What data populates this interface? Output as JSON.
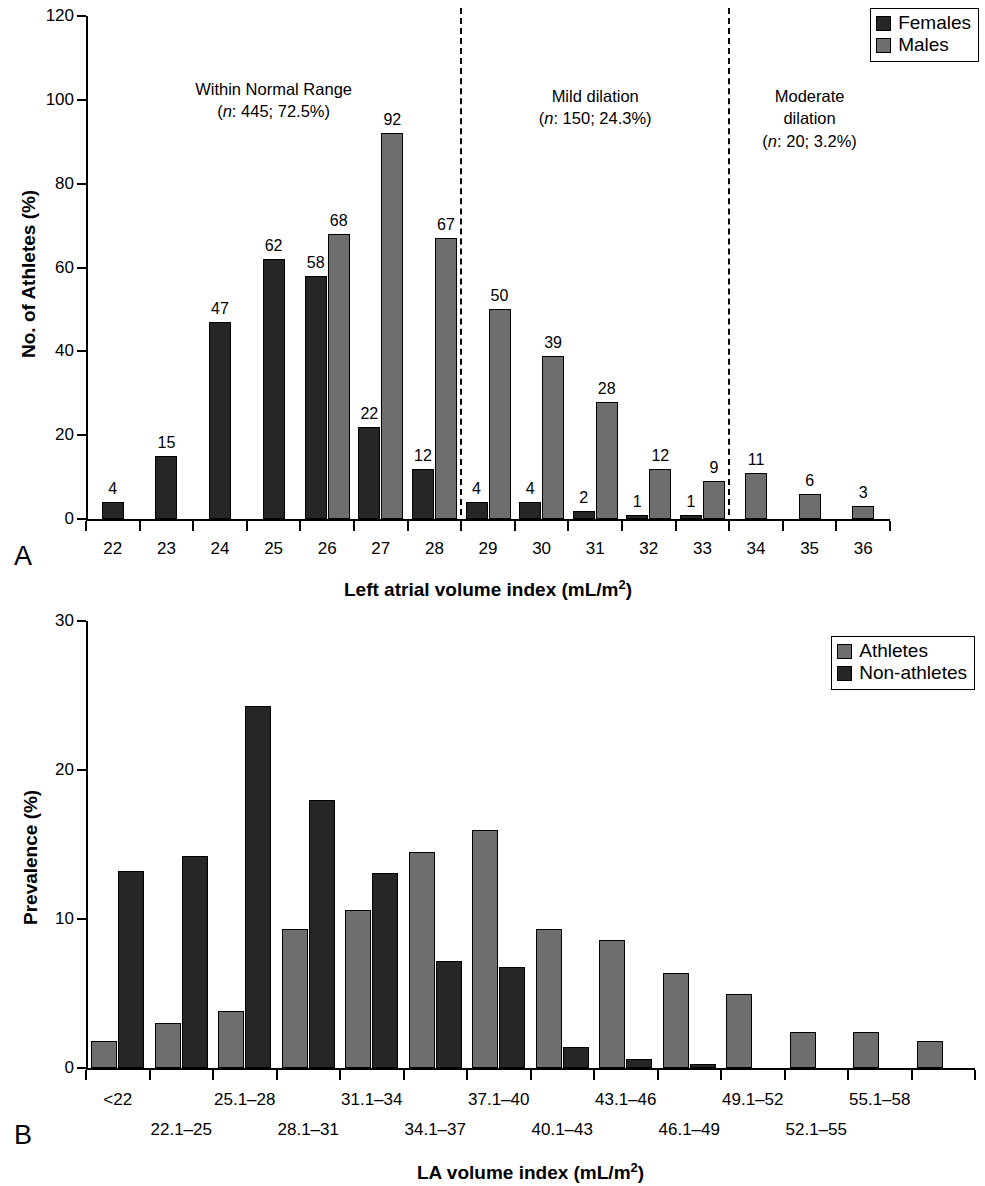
{
  "figure": {
    "panels": [
      {
        "letter": "A"
      },
      {
        "letter": "B"
      }
    ]
  },
  "panelA": {
    "letter": "A",
    "ylabel": "No. of Athletes (%)",
    "xlabel_main": "Left atrial volume index (mL/m",
    "xlabel_sup": "2",
    "xlabel_tail": ")",
    "legend": [
      {
        "key": "females",
        "label": "Females",
        "color": "#262626"
      },
      {
        "key": "males",
        "label": "Males",
        "color": "#6e6e6e"
      }
    ],
    "regions": [
      {
        "title": "Within Normal Range",
        "n_label": "n",
        "n_text": ": 445; 72.5%"
      },
      {
        "title": "Mild dilation",
        "n_label": "n",
        "n_text": ": 150; 24.3%"
      },
      {
        "title_line1": "Moderate",
        "title_line2": "dilation",
        "n_label": "n",
        "n_text": ": 20; 3.2%"
      }
    ]
  },
  "panelB": {
    "letter": "B",
    "ylabel": "Prevalence (%)",
    "xlabel_main": "LA volume index (mL/m",
    "xlabel_sup": "2",
    "xlabel_tail": ")",
    "legend": [
      {
        "key": "athletes",
        "label": "Athletes",
        "color": "#6e6e6e"
      },
      {
        "key": "non-athletes",
        "label": "Non-athletes",
        "color": "#262626"
      }
    ]
  },
  "chart_data": [
    {
      "id": "panel-a",
      "type": "bar",
      "title": "",
      "xlabel": "Left atrial volume index (mL/m2)",
      "ylabel": "No. of Athletes (%)",
      "ylim": [
        0,
        120
      ],
      "yticks": [
        0,
        20,
        40,
        60,
        80,
        100,
        120
      ],
      "grid": false,
      "legend_position": "top-right",
      "categories": [
        "22",
        "23",
        "24",
        "25",
        "26",
        "27",
        "28",
        "29",
        "30",
        "31",
        "32",
        "33",
        "34",
        "35",
        "36"
      ],
      "series": [
        {
          "name": "Females",
          "color": "#262626",
          "values": [
            4,
            15,
            47,
            62,
            58,
            22,
            12,
            4,
            4,
            2,
            1,
            1,
            null,
            null,
            null
          ]
        },
        {
          "name": "Males",
          "color": "#6e6e6e",
          "values": [
            null,
            null,
            null,
            null,
            68,
            92,
            67,
            50,
            39,
            28,
            12,
            9,
            11,
            6,
            3
          ]
        }
      ],
      "annotations": [
        {
          "text": "Within Normal Range (n: 445; 72.5%)",
          "region_categories": [
            "22",
            "28"
          ]
        },
        {
          "text": "Mild dilation (n: 150; 24.3%)",
          "region_categories": [
            "29",
            "33"
          ]
        },
        {
          "text": "Moderate dilation (n: 20; 3.2%)",
          "region_categories": [
            "34",
            "36"
          ]
        }
      ],
      "dividers_after_category": [
        "28",
        "33"
      ]
    },
    {
      "id": "panel-b",
      "type": "bar",
      "title": "",
      "xlabel": "LA volume index (mL/m2)",
      "ylabel": "Prevalence (%)",
      "ylim": [
        0,
        30
      ],
      "yticks": [
        0,
        10,
        20,
        30
      ],
      "grid": false,
      "legend_position": "top-right",
      "categories": [
        "<22",
        "22.1–25",
        "25.1–28",
        "28.1–31",
        "31.1–34",
        "34.1–37",
        "37.1–40",
        "40.1–43",
        "43.1–46",
        "46.1–49",
        "49.1–52",
        "52.1–55",
        "55.1–58",
        ""
      ],
      "series": [
        {
          "name": "Athletes",
          "color": "#6e6e6e",
          "values": [
            1.8,
            3.0,
            3.8,
            9.3,
            10.6,
            14.5,
            16.0,
            9.3,
            8.6,
            6.4,
            5.0,
            2.4,
            2.4,
            1.8
          ]
        },
        {
          "name": "Non-athletes",
          "color": "#262626",
          "values": [
            13.2,
            14.2,
            24.3,
            18.0,
            13.1,
            7.2,
            6.8,
            1.4,
            0.6,
            0.25,
            null,
            null,
            null,
            null
          ]
        }
      ]
    }
  ]
}
